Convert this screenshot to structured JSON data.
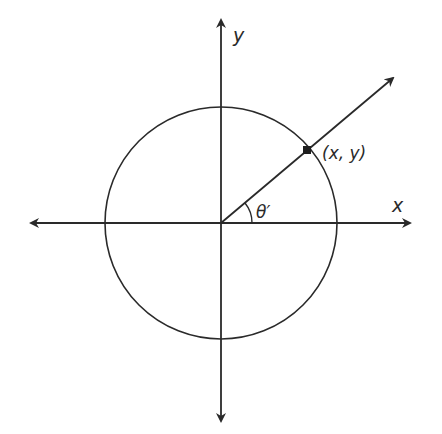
{
  "diagram": {
    "type": "unit-circle-reference-angle",
    "labels": {
      "x_axis": "x",
      "y_axis": "y",
      "point": "(x, y)",
      "angle": "θ′"
    },
    "colors": {
      "stroke": "#2a2a2a",
      "background": "#ffffff"
    }
  }
}
